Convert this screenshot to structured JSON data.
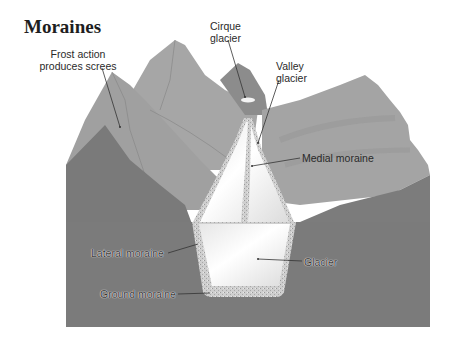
{
  "title": "Moraines",
  "labels": {
    "frost_action": "Frost action\nproduces screes",
    "frost_action_line1": "Frost action",
    "frost_action_line2": "produces screes",
    "cirque_line1": "Cirque",
    "cirque_line2": "glacier",
    "valley_line1": "Valley",
    "valley_line2": "glacier",
    "medial_moraine": "Medial moraine",
    "lateral_moraine": "Lateral moraine",
    "glacier": "Glacier",
    "ground_moraine": "Ground moraine"
  },
  "colors": {
    "background": "#ffffff",
    "far_mountain": "#a8a8a8",
    "mid_mountain": "#9a9a9a",
    "right_ridge": "#a2a2a2",
    "bedrock": "#7a7a7a",
    "dark_rock": "#6e6e6e",
    "ice": "#f2f2f2",
    "moraine": "#c8c8c8",
    "leader_line": "#333333"
  }
}
